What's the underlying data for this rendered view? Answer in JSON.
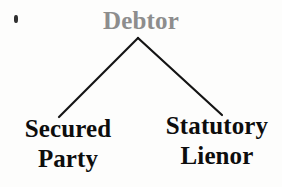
{
  "diagram": {
    "type": "tree",
    "background_color": "#fdfdfc",
    "root": {
      "label": "Debtor",
      "color": "#8d8d8d",
      "x": 138,
      "y": 20
    },
    "children": [
      {
        "id": "secured-party",
        "label_line1": "Secured",
        "label_line2": "Party",
        "color": "#0d0d0d",
        "x": 66,
        "y": 150
      },
      {
        "id": "statutory-lienor",
        "label_line1": "Statutory",
        "label_line2": "Lienor",
        "color": "#0d0d0d",
        "x": 219,
        "y": 148
      }
    ],
    "edges": [
      {
        "id": "edge-debtor-secured-party",
        "from": "debtor",
        "to": "secured-party",
        "x1": 138,
        "y1": 38,
        "x2": 59,
        "y2": 117,
        "color": "#141414",
        "width": 2.2
      },
      {
        "id": "edge-debtor-statutory-lienor",
        "from": "debtor",
        "to": "statutory-lienor",
        "x1": 138,
        "y1": 38,
        "x2": 222,
        "y2": 115,
        "color": "#141414",
        "width": 2.2
      }
    ],
    "artifact": {
      "name": "scan-speck",
      "x": 16,
      "y": 19
    }
  }
}
